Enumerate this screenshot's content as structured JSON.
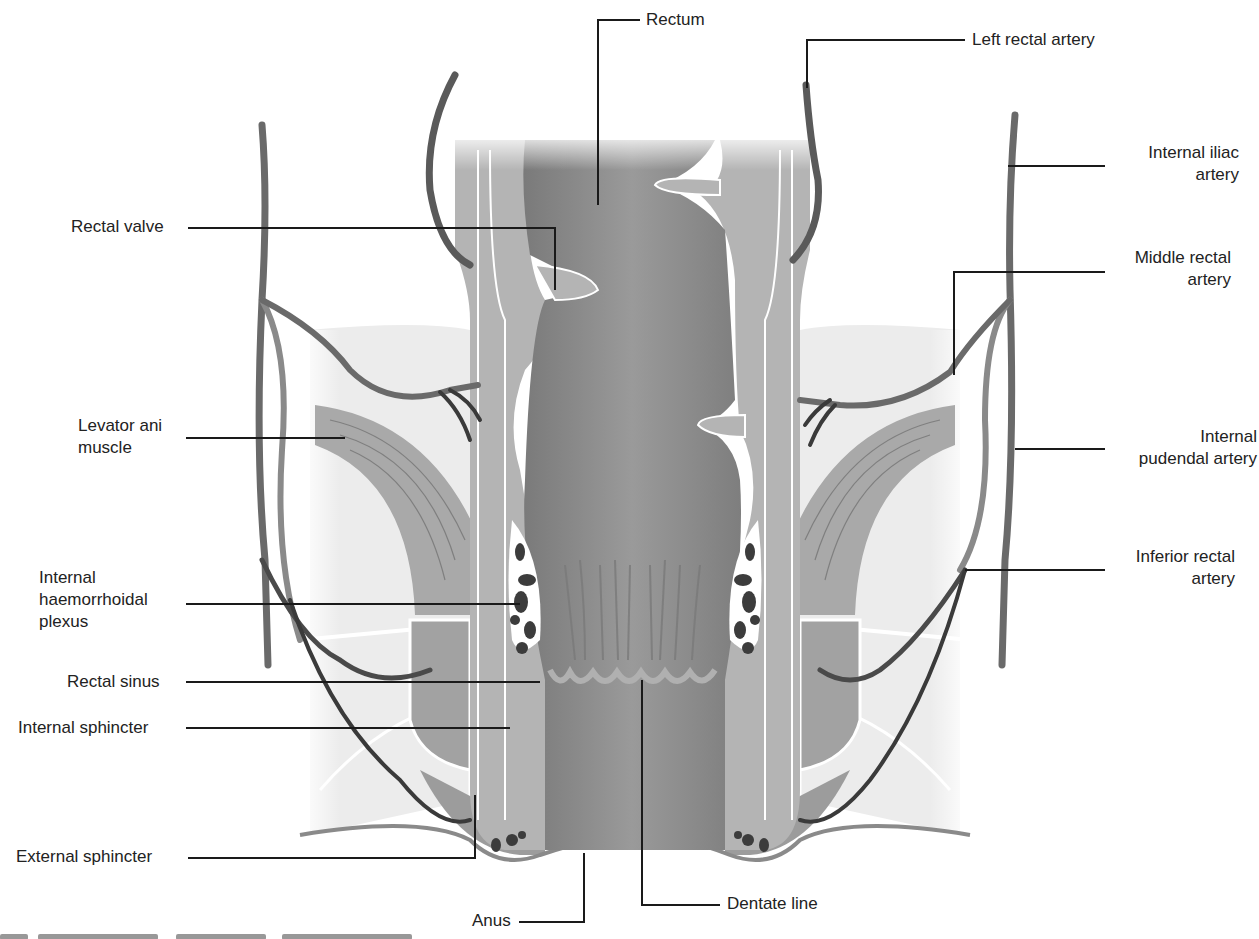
{
  "diagram": {
    "type": "anatomical-illustration",
    "colors": {
      "background": "#ffffff",
      "lumen": "#8f8f8f",
      "wall": "#b5b5b5",
      "muscle": "#9a9a9a",
      "fat": "#e6e6e6",
      "vessel": "#6a6a6a",
      "vessel_dark": "#3a3a3a",
      "leader_line": "#1a1a1a",
      "label_text": "#222222"
    }
  },
  "labels": {
    "rectum": "Rectum",
    "left_rectal_artery": "Left rectal artery",
    "internal_iliac_artery": [
      "Internal iliac",
      "artery"
    ],
    "rectal_valve": "Rectal valve",
    "middle_rectal_artery": [
      "Middle rectal",
      "artery"
    ],
    "levator_ani_muscle": [
      "Levator ani",
      "muscle"
    ],
    "internal_pudendal_artery": [
      "Internal",
      "pudendal artery"
    ],
    "internal_haemorrhoidal_plexus": [
      "Internal",
      "haemorrhoidal",
      "plexus"
    ],
    "inferior_rectal_artery": [
      "Inferior rectal",
      "artery"
    ],
    "rectal_sinus": "Rectal sinus",
    "internal_sphincter": "Internal sphincter",
    "external_sphincter": "External sphincter",
    "anus": "Anus",
    "dentate_line": "Dentate line"
  }
}
